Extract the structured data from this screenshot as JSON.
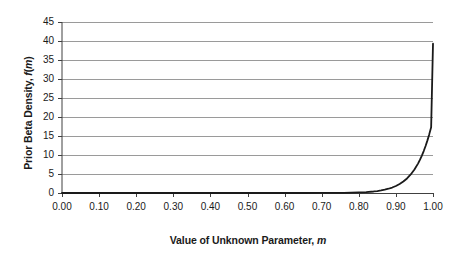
{
  "chart_data": {
    "type": "line",
    "title": "",
    "subtitle": "",
    "xlabel_plain": "Value of Unknown Parameter, m",
    "xlabel_text": "Value of Unknown Parameter,",
    "xlabel_symbol": "m",
    "ylabel_plain": "Prior Beta Density, f(m)",
    "ylabel_text_a": "Prior Beta Density,",
    "ylabel_symbol_f": "f",
    "ylabel_paren_open": "(",
    "ylabel_symbol_m": "m",
    "ylabel_paren_close": ")",
    "xlim": [
      0.0,
      1.0
    ],
    "ylim": [
      0,
      45
    ],
    "x_ticks": [
      0.0,
      0.1,
      0.2,
      0.3,
      0.4,
      0.5,
      0.6,
      0.7,
      0.8,
      0.9,
      1.0
    ],
    "x_tick_labels": [
      "0.00",
      "0.10",
      "0.20",
      "0.30",
      "0.40",
      "0.50",
      "0.60",
      "0.70",
      "0.80",
      "0.90",
      "1.00"
    ],
    "y_ticks": [
      0,
      5,
      10,
      15,
      20,
      25,
      30,
      35,
      40,
      45
    ],
    "y_tick_labels": [
      "0",
      "5",
      "10",
      "15",
      "20",
      "25",
      "30",
      "35",
      "40",
      "45"
    ],
    "grid": {
      "horizontal": true,
      "vertical": false,
      "color": "#808080"
    },
    "legend": {
      "visible": false,
      "position": "none",
      "entries": []
    },
    "series": [
      {
        "name": "Prior Beta Density",
        "color": "#1a1a1a",
        "line_width": 1.8,
        "description": "Beta density proportional to m^39; near zero until m approx 0.85 then rises steeply to about 39.3 at m = 1.00",
        "x": [
          0.0,
          0.05,
          0.1,
          0.15,
          0.2,
          0.25,
          0.3,
          0.35,
          0.4,
          0.45,
          0.5,
          0.55,
          0.6,
          0.65,
          0.7,
          0.72,
          0.74,
          0.76,
          0.78,
          0.8,
          0.82,
          0.84,
          0.85,
          0.86,
          0.87,
          0.88,
          0.89,
          0.9,
          0.91,
          0.92,
          0.93,
          0.94,
          0.95,
          0.96,
          0.965,
          0.97,
          0.975,
          0.98,
          0.985,
          0.99,
          0.995,
          1.0
        ],
        "y": [
          0.0,
          0.0,
          0.0,
          0.0,
          0.0,
          0.0,
          0.0,
          0.0,
          0.0,
          0.0,
          0.0,
          0.0,
          0.0,
          0.0,
          0.01,
          0.02,
          0.03,
          0.05,
          0.08,
          0.14,
          0.24,
          0.4,
          0.52,
          0.67,
          0.87,
          1.12,
          1.44,
          1.84,
          2.36,
          3.01,
          3.83,
          4.87,
          6.17,
          7.8,
          8.77,
          9.84,
          11.04,
          12.37,
          13.85,
          15.49,
          17.31,
          39.3
        ],
        "y_at_x_max": 39.3
      }
    ],
    "axes": {
      "x_axis_line_color": "#404040",
      "y_axis_line_color": "#404040",
      "tick_color": "#404040",
      "background": "#ffffff"
    },
    "plot_box": {
      "left_px": 62,
      "right_px": 433,
      "top_px": 22,
      "bottom_px": 193
    }
  }
}
